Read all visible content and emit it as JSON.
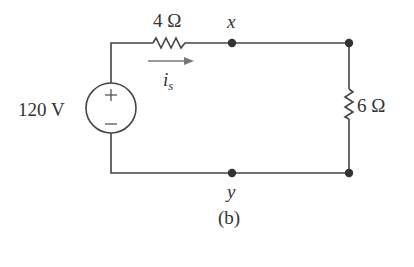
{
  "diagram": {
    "type": "electrical-circuit",
    "caption": "(b)",
    "source": {
      "label": "120 V",
      "kind": "independent-voltage-source",
      "polarity_top": "+",
      "polarity_bottom": "−"
    },
    "resistors": [
      {
        "id": "R1",
        "label": "4 Ω",
        "orientation": "horizontal",
        "position": "top-left branch"
      },
      {
        "id": "R2",
        "label": "6 Ω",
        "orientation": "vertical",
        "position": "right branch"
      }
    ],
    "current": {
      "label_main": "i",
      "label_sub": "s",
      "direction": "right"
    },
    "nodes": [
      {
        "id": "x",
        "label": "x",
        "position": "top wire"
      },
      {
        "id": "top-right",
        "label": "",
        "position": "top-right corner"
      },
      {
        "id": "y",
        "label": "y",
        "position": "bottom wire"
      },
      {
        "id": "bottom-right",
        "label": "",
        "position": "bottom-right corner"
      }
    ],
    "colors": {
      "wire": "#444444",
      "node": "#333333",
      "arrow": "#777777",
      "background": "#ffffff"
    }
  }
}
